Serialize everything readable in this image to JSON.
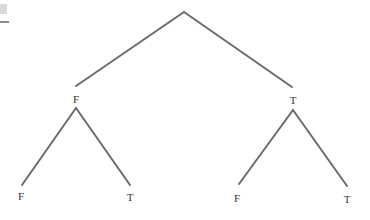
{
  "diagram": {
    "type": "binary-tree",
    "root": {
      "x": 184,
      "y": 12,
      "label": ""
    },
    "level1": [
      {
        "x": 76,
        "y": 86,
        "label": "F"
      },
      {
        "x": 292,
        "y": 87,
        "label": "T"
      }
    ],
    "level2": [
      {
        "x": 22,
        "y": 185,
        "label": "F",
        "parent": 0
      },
      {
        "x": 130,
        "y": 185,
        "label": "T",
        "parent": 0
      },
      {
        "x": 239,
        "y": 184,
        "label": "F",
        "parent": 1
      },
      {
        "x": 347,
        "y": 186,
        "label": "T",
        "parent": 1
      }
    ],
    "edge_color": "#6b6b6b",
    "label_color": "#333333"
  }
}
